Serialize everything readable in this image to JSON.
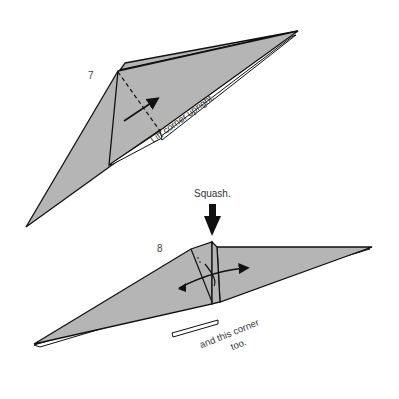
{
  "diagram": {
    "colors": {
      "paper": "#b5b5b5",
      "line": "#111111",
      "background": "#ffffff",
      "text": "#333333"
    },
    "steps": [
      {
        "number": "7",
        "instruction": "Lift corner upright.",
        "icons": [
          "dashed-fold-line",
          "lift-arrow"
        ]
      },
      {
        "number": "8",
        "instruction_top": "Squash.",
        "instruction_bottom_line1": "and this corner",
        "instruction_bottom_line2": "too.",
        "icons": [
          "squash-arrow",
          "double-curved-arrow"
        ]
      }
    ]
  }
}
